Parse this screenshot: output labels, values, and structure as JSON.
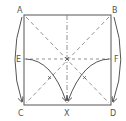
{
  "diagram": {
    "type": "origami-fold",
    "labels": {
      "A": "A",
      "B": "B",
      "C": "C",
      "D": "D",
      "E": "E",
      "F": "F",
      "X": "X"
    },
    "colors": {
      "stroke": "#555555",
      "dash": "#777777",
      "background": "#ffffff"
    },
    "lines": [
      {
        "name": "square-outline",
        "style": "solid"
      },
      {
        "name": "diagonal-AD",
        "style": "dashed"
      },
      {
        "name": "diagonal-BC",
        "style": "dashed"
      },
      {
        "name": "horizontal-EF",
        "style": "dashed"
      },
      {
        "name": "vertical-center",
        "style": "dash-dot"
      },
      {
        "name": "arc-E-to-X",
        "style": "solid-arrow"
      },
      {
        "name": "arc-F-to-X",
        "style": "solid-arrow"
      },
      {
        "name": "arc-A-to-C",
        "style": "solid-arrow"
      },
      {
        "name": "arc-B-to-D",
        "style": "solid-arrow"
      }
    ]
  }
}
